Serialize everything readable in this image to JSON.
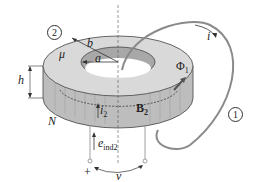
{
  "diagram": {
    "labels": {
      "circuit_2": "2",
      "circuit_1": "1",
      "permeability": "μ",
      "outer_radius": "b",
      "inner_radius": "a",
      "height": "h",
      "turns": "N",
      "loop_current": "i",
      "flux": "Φ",
      "flux_sub": "1",
      "secondary_current": "i",
      "secondary_current_sub": "2",
      "field": "B",
      "field_sub": "2",
      "emf": "e",
      "emf_sub": "ind2",
      "voltage": "v",
      "plus": "+"
    },
    "colors": {
      "core_top": "#d9d9d9",
      "core_side": "#b8b8b8",
      "core_inner": "#a8a8a8",
      "loop_wire": "#8a8a8a",
      "line": "#333333"
    }
  }
}
